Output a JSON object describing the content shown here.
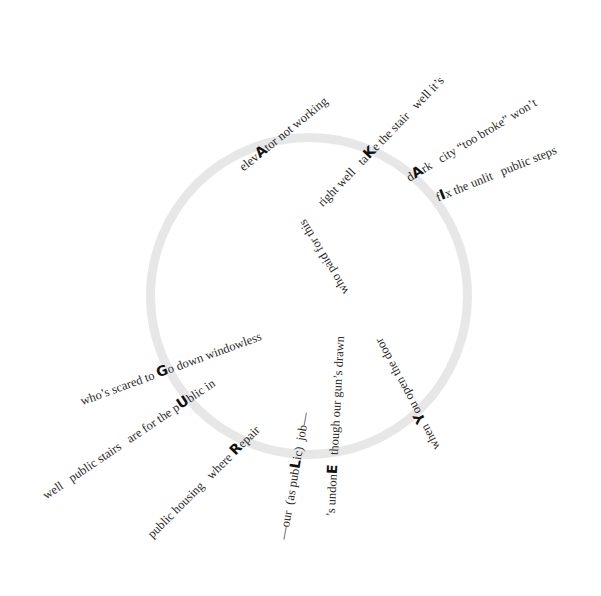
{
  "poem": {
    "ring": {
      "cx": 309,
      "cy": 296,
      "r": 163,
      "color": "#e6e6e6"
    },
    "acrostic_word": "GUARDIAN",
    "lines": [
      {
        "id": "elevator",
        "pre": "elev",
        "key": "A",
        "post": "tor not working",
        "x": 218,
        "y": 160,
        "angle": -39
      },
      {
        "id": "take-the-stair",
        "pre": "right well   ta",
        "key": "K",
        "post": "e the stair   well it’s",
        "x": 296,
        "y": 199,
        "angle": -46
      },
      {
        "id": "dark",
        "pre": "d",
        "key": "A",
        "post": "rk   city “too broke” won’t",
        "x": 386,
        "y": 167,
        "angle": -31
      },
      {
        "id": "fix",
        "pre": "f",
        "key": "I",
        "post": "x the unlit   public steps",
        "x": 417,
        "y": 183,
        "angle": -22
      },
      {
        "id": "go-down",
        "pre": "who’s scared to ",
        "key": "G",
        "post": "o down windowless",
        "x": 62,
        "y": 386,
        "angle": -20
      },
      {
        "id": "public",
        "pre": "well   public stairs   are for the p",
        "key": "U",
        "post": "blic in",
        "x": 22,
        "y": 486,
        "angle": -34
      },
      {
        "id": "repair",
        "pre": "public housing   where ",
        "key": "R",
        "post": "epair",
        "x": 126,
        "y": 530,
        "angle": -45
      },
      {
        "id": "job",
        "pre": "—our  (as pub",
        "key": "L",
        "post": "ic)  job—",
        "x": 260,
        "y": 548,
        "angle": -80
      },
      {
        "id": "undone",
        "pre": "’s undon",
        "key": "E",
        "post": "   though our gun’s drawn",
        "x": 309,
        "y": 528,
        "angle": -87
      },
      {
        "id": "who-paid",
        "pre": "who paid for this",
        "key": "",
        "post": "",
        "x": 334,
        "y": 315,
        "angle": -121
      },
      {
        "id": "when-you",
        "pre": "when ",
        "key": "Y",
        "post": "ou open the door",
        "x": 424,
        "y": 470,
        "angle": -118
      }
    ]
  }
}
